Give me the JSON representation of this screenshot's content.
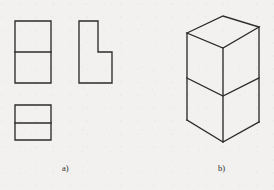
{
  "figure": {
    "background_color": "#f2f1ef",
    "line_color": "#2b2b2b",
    "line_width": 1.35,
    "captions": {
      "a": "a)",
      "b": "b)"
    }
  },
  "chart_data": {
    "type": "diagram",
    "subtitle": "",
    "xlabel": "",
    "ylabel": "",
    "grid": false,
    "legend": "none",
    "panels": [
      {
        "id": "a",
        "label": "a)",
        "label_position": [
          67,
          168
        ],
        "name": "orthographic-views",
        "description": "Three 2D orthographic projection views of the part",
        "views": [
          {
            "name": "front-view",
            "shape": "rectangle-with-horizontal-division",
            "outline": [
              [
                15,
                21
              ],
              [
                51,
                21
              ],
              [
                51,
                83
              ],
              [
                15,
                83
              ]
            ],
            "internal_lines": [
              [
                [
                  15,
                  52
                ],
                [
                  51,
                  52
                ]
              ]
            ],
            "width": 36,
            "height": 62
          },
          {
            "name": "side-view",
            "shape": "L-profile",
            "outline": [
              [
                79,
                21
              ],
              [
                98,
                21
              ],
              [
                98,
                52
              ],
              [
                112,
                52
              ],
              [
                112,
                83
              ],
              [
                79,
                83
              ]
            ],
            "internal_lines": [],
            "width": 33,
            "height": 62
          },
          {
            "name": "top-view",
            "shape": "rectangle-with-horizontal-division",
            "outline": [
              [
                15,
                105
              ],
              [
                51,
                105
              ],
              [
                51,
                140
              ],
              [
                15,
                140
              ]
            ],
            "internal_lines": [
              [
                [
                  15,
                  123
                ],
                [
                  51,
                  123
                ]
              ]
            ],
            "width": 36,
            "height": 35
          }
        ]
      },
      {
        "id": "b",
        "label": "b)",
        "label_position": [
          223,
          168
        ],
        "name": "isometric-view",
        "description": "Isometric pictorial view of the stepped L-shaped block",
        "vertices": {
          "top_back_apex": [
            223,
            16
          ],
          "top_left": [
            187,
            33
          ],
          "top_front": [
            223,
            48
          ],
          "top_right": [
            259,
            27
          ],
          "upper_right_lower": [
            259,
            78
          ],
          "step_right_back": [
            259,
            78
          ],
          "step_inner_front": [
            223,
            96
          ],
          "step_left": [
            187,
            78
          ],
          "bottom_left": [
            187,
            120
          ],
          "bottom_front": [
            223,
            142
          ],
          "bottom_right": [
            259,
            122
          ],
          "upper_front_bottom": [
            223,
            96
          ]
        },
        "edges": [
          {
            "from": "top_left",
            "to": "top_back_apex",
            "type": "visible"
          },
          {
            "from": "top_back_apex",
            "to": "top_right",
            "type": "visible"
          },
          {
            "from": "top_right",
            "to": "top_front",
            "type": "visible"
          },
          {
            "from": "top_front",
            "to": "top_left",
            "type": "visible"
          },
          {
            "from": "top_left",
            "to": "bottom_left",
            "type": "visible"
          },
          {
            "from": "top_front",
            "to": "bottom_front",
            "type": "visible"
          },
          {
            "from": "top_right",
            "to": "upper_right_lower",
            "type": "visible"
          },
          {
            "from": "upper_right_lower",
            "to": "step_inner_front",
            "type": "visible"
          },
          {
            "from": "step_inner_front",
            "to": "step_left",
            "type": "visible"
          },
          {
            "from": "upper_right_lower",
            "to": "bottom_right",
            "type": "visible"
          },
          {
            "from": "bottom_right",
            "to": "bottom_front",
            "type": "visible"
          },
          {
            "from": "bottom_front",
            "to": "bottom_left",
            "type": "visible"
          }
        ],
        "faces": [
          "top-face",
          "upper-left-face",
          "upper-front-face",
          "step-horizontal-face",
          "lower-right-face",
          "lower-front-face"
        ]
      }
    ]
  }
}
